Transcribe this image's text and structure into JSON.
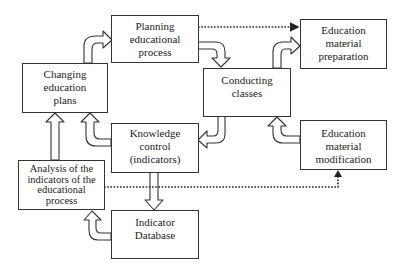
{
  "diagram": {
    "nodes": {
      "planning": {
        "lines": [
          "Planning",
          "educational",
          "process"
        ]
      },
      "prep": {
        "lines": [
          "Education",
          "material",
          "preparation"
        ]
      },
      "conducting": {
        "lines": [
          "Conducting",
          "classes"
        ]
      },
      "changing": {
        "lines": [
          "Changing",
          "education",
          "plans"
        ]
      },
      "knowledge": {
        "lines": [
          "Knowledge",
          "control",
          "(indicators)"
        ]
      },
      "modification": {
        "lines": [
          "Education",
          "material",
          "modification"
        ]
      },
      "analysis": {
        "lines": [
          "Analysis of the",
          "indicators of the",
          "educational",
          "process"
        ]
      },
      "database": {
        "lines": [
          "Indicator",
          "Database"
        ]
      }
    },
    "edges": [
      {
        "from": "changing",
        "to": "planning",
        "style": "block-arrow"
      },
      {
        "from": "planning",
        "to": "conducting",
        "style": "block-arrow"
      },
      {
        "from": "conducting",
        "to": "prep",
        "style": "block-arrow"
      },
      {
        "from": "conducting",
        "to": "knowledge",
        "style": "block-arrow"
      },
      {
        "from": "modification",
        "to": "conducting",
        "style": "block-arrow"
      },
      {
        "from": "knowledge",
        "to": "changing",
        "style": "block-arrow"
      },
      {
        "from": "knowledge",
        "to": "database",
        "style": "block-arrow"
      },
      {
        "from": "analysis",
        "to": "changing",
        "style": "block-arrow"
      },
      {
        "from": "database",
        "to": "analysis",
        "style": "block-arrow"
      },
      {
        "from": "planning",
        "to": "prep",
        "style": "dotted-arrow"
      },
      {
        "from": "analysis",
        "to": "modification",
        "style": "dotted-arrow"
      }
    ]
  }
}
